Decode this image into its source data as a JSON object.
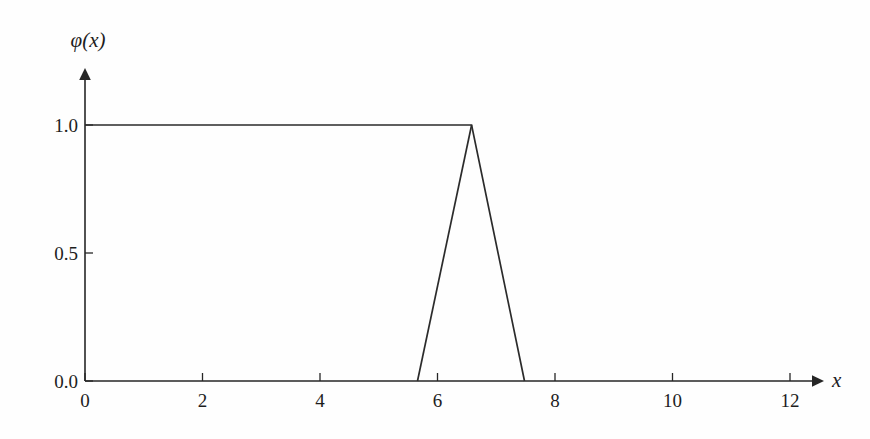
{
  "chart_data": {
    "type": "line",
    "title": "",
    "subtitle": "",
    "xlabel": "x",
    "ylabel": "φ(x)",
    "xlim": [
      0,
      12
    ],
    "ylim": [
      0.0,
      1.0
    ],
    "grid": false,
    "legend": null,
    "xticks": [
      0,
      2,
      4,
      6,
      8,
      10,
      12
    ],
    "xtick_labels": [
      "0",
      "2",
      "4",
      "6",
      "8",
      "10",
      "12"
    ],
    "yticks": [
      0.0,
      0.5,
      1.0
    ],
    "ytick_labels": [
      "0.0",
      "0.5",
      "1.0"
    ],
    "axis_arrows": {
      "x": true,
      "y": true
    },
    "line_color": "#2b2b2b",
    "background_color": "#fefefe",
    "series": [
      {
        "name": "plateau-and-falling-edge",
        "x": [
          0.0,
          6.58,
          7.48
        ],
        "values": [
          1.0,
          1.0,
          0.0
        ]
      },
      {
        "name": "rising-edge",
        "x": [
          5.66,
          6.58
        ],
        "values": [
          0.0,
          1.0
        ]
      }
    ],
    "annotations": []
  },
  "labels": {
    "y_axis_name": "φ(x)",
    "x_axis_name": "x"
  }
}
